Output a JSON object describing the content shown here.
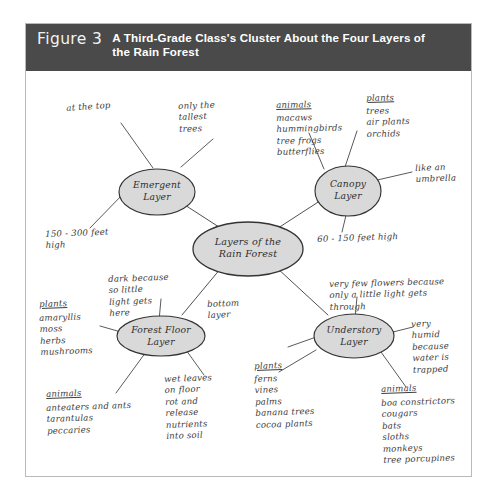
{
  "figure": {
    "number_label": "Figure 3",
    "caption": "A Third-Grade Class's Cluster About the Four Layers of the Rain Forest",
    "header_bg": "#4a4a4a",
    "header_text_color": "#ffffff",
    "frame_border_color": "#b9b9b9",
    "page_bg": "#ffffff"
  },
  "cluster": {
    "ink_color": "#3c3c3c",
    "bubble_fill": "#d9d9d9",
    "bubble_stroke": "#333333",
    "center": {
      "id": "center-bubble",
      "label": "Layers of the\nRain Forest"
    },
    "bubbles": [
      {
        "id": "emergent-layer-bubble",
        "label": "Emergent\nLayer"
      },
      {
        "id": "canopy-layer-bubble",
        "label": "Canopy\nLayer"
      },
      {
        "id": "forest-floor-layer-bubble",
        "label": "Forest Floor\nLayer"
      },
      {
        "id": "understory-layer-bubble",
        "label": "Understory\nLayer"
      }
    ],
    "notes": {
      "at_the_top": "at the top",
      "only_the_tallest_trees": "only the\ntallest\ntrees",
      "height_150_300": "150 - 300 feet\nhigh",
      "canopy_animals_header": "animals",
      "canopy_animals_list": "macaws\nhummingbirds\ntree frogs\nbutterflies",
      "canopy_plants_header": "plants",
      "canopy_plants_list": "trees\nair plants\norchids",
      "like_an_umbrella": "like an\numbrella",
      "height_60_150": "60 - 150 feet high",
      "dark_because": "dark because\nso little\nlight gets\nhere",
      "forest_plants_header": "plants",
      "forest_plants_list": "amaryllis\nmoss\nherbs\nmushrooms",
      "bottom_layer": "bottom\nlayer",
      "forest_animals_header": "animals",
      "forest_animals_list": "anteaters and ants\ntarantulas\npeccaries",
      "wet_leaves": "wet leaves\non floor\nrot and\nrelease\nnutrients\ninto soil",
      "very_few_flowers": "very few flowers because\nonly a little light gets\nthrough",
      "understory_plants_header": "plants",
      "understory_plants_list": "ferns\nvines\npalms\nbanana trees\ncocoa plants",
      "very_humid": "very\nhumid\nbecause\nwater is\ntrapped",
      "understory_animals_header": "animals",
      "understory_animals_list": "boa constrictors\ncougars\nbats\nsloths\nmonkeys\ntree porcupines"
    }
  }
}
